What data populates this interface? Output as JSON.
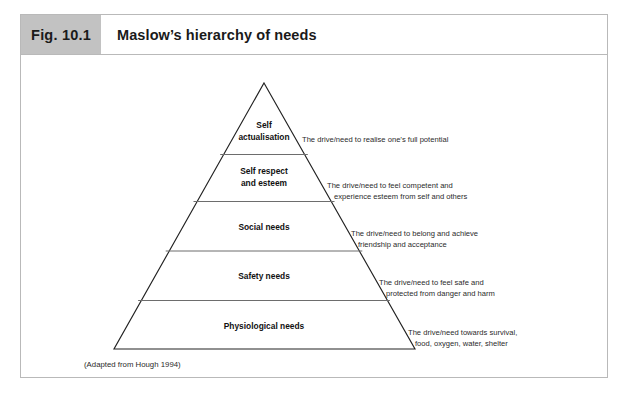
{
  "figure": {
    "number": "Fig. 10.1",
    "title": "Maslow’s hierarchy of needs",
    "source": "(Adapted from Hough 1994)"
  },
  "colors": {
    "number_box_bg": "#c2c2c2",
    "frame_border": "#b9b9b9",
    "pyramid_stroke": "#222222",
    "divider_stroke": "#6d6d6d",
    "text": "#1a1a1a"
  },
  "pyramid": {
    "tiers": [
      {
        "id": "self-actualisation",
        "label_lines": [
          "Self",
          "actualisation"
        ],
        "description_lines": [
          "The drive/need to realise one’s full potential"
        ]
      },
      {
        "id": "self-respect-and-esteem",
        "label_lines": [
          "Self respect",
          "and esteem"
        ],
        "description_lines": [
          "The drive/need to feel competent and",
          "experience esteem from self and others"
        ]
      },
      {
        "id": "social-needs",
        "label_lines": [
          "Social needs"
        ],
        "description_lines": [
          "The drive/need to belong and achieve",
          "friendship and acceptance"
        ]
      },
      {
        "id": "safety-needs",
        "label_lines": [
          "Safety needs"
        ],
        "description_lines": [
          "The drive/need to feel safe and",
          "protected from danger and harm"
        ]
      },
      {
        "id": "physiological-needs",
        "label_lines": [
          "Physiological needs"
        ],
        "description_lines": [
          "The drive/need towards survival,",
          "food, oxygen, water, shelter"
        ]
      }
    ]
  }
}
